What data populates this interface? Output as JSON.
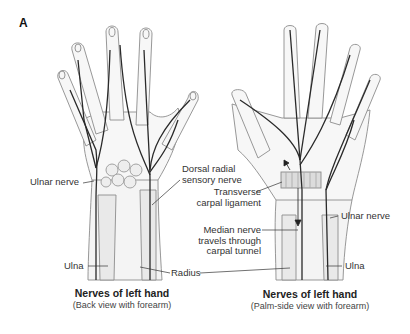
{
  "figure": {
    "panel_letter": "A",
    "left_panel": {
      "title": "Nerves of left hand",
      "subtitle": "(Back view with forearm)",
      "labels": {
        "ulnar_nerve": "Ulnar nerve",
        "ulna": "Ulna"
      }
    },
    "right_panel": {
      "title": "Nerves of left hand",
      "subtitle": "(Palm-side view with forearm)",
      "labels": {
        "ulnar_nerve": "Ulnar nerve",
        "ulna": "Ulna"
      }
    },
    "shared_labels": {
      "dorsal_radial_line1": "Dorsal radial",
      "dorsal_radial_line2": "sensory nerve",
      "transverse_line1": "Transverse",
      "transverse_line2": "carpal ligament",
      "median_line1": "Median nerve",
      "median_line2": "travels through",
      "median_line3": "carpal tunnel",
      "radius": "Radius"
    },
    "colors": {
      "nerve": "#2a2a2a",
      "outline": "#8c8c8c",
      "bone_fill": "#ececec",
      "ligament": "#d6d6d6"
    }
  }
}
